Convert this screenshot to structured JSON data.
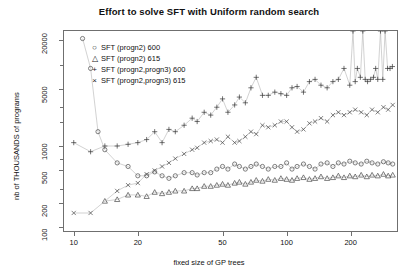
{
  "chart_data": {
    "type": "scatter",
    "title": "Effort to solve SFT with Uniform random search",
    "xlabel": "fixed size of GP trees",
    "ylabel": "nb of THOUSANDS of programs",
    "xscale": "log",
    "yscale": "log",
    "xlim": [
      9,
      330
    ],
    "ylim": [
      90,
      26000
    ],
    "xticks": [
      10,
      20,
      50,
      100,
      200
    ],
    "xticklabels": [
      "10",
      "20",
      "50",
      "100",
      "200"
    ],
    "yticks": [
      100,
      200,
      500,
      1000,
      5000,
      20000
    ],
    "yticklabels": [
      "100",
      "200",
      "500",
      "1000",
      "5000",
      "20000"
    ],
    "grid": false,
    "legend_position": "top-left",
    "lines": true,
    "series": [
      {
        "name": "SFT (progn2) 600",
        "symbol": "circle",
        "color": "#4a4a4a",
        "points": [
          [
            11,
            21000
          ],
          [
            12,
            9000
          ],
          [
            13,
            1500
          ],
          [
            14,
            900
          ],
          [
            16,
            620
          ],
          [
            18,
            560
          ],
          [
            20,
            430
          ],
          [
            22,
            430
          ],
          [
            24,
            480
          ],
          [
            26,
            430
          ],
          [
            28,
            400
          ],
          [
            30,
            430
          ],
          [
            33,
            470
          ],
          [
            36,
            470
          ],
          [
            38,
            440
          ],
          [
            41,
            470
          ],
          [
            44,
            470
          ],
          [
            47,
            520
          ],
          [
            50,
            560
          ],
          [
            53,
            520
          ],
          [
            57,
            600
          ],
          [
            60,
            560
          ],
          [
            64,
            520
          ],
          [
            68,
            560
          ],
          [
            72,
            600
          ],
          [
            77,
            560
          ],
          [
            82,
            520
          ],
          [
            88,
            560
          ],
          [
            94,
            560
          ],
          [
            100,
            620
          ],
          [
            106,
            520
          ],
          [
            112,
            560
          ],
          [
            120,
            600
          ],
          [
            128,
            560
          ],
          [
            136,
            520
          ],
          [
            145,
            600
          ],
          [
            155,
            620
          ],
          [
            165,
            560
          ],
          [
            175,
            620
          ],
          [
            186,
            600
          ],
          [
            198,
            650
          ],
          [
            210,
            620
          ],
          [
            224,
            600
          ],
          [
            238,
            650
          ],
          [
            252,
            620
          ],
          [
            268,
            600
          ],
          [
            285,
            640
          ],
          [
            300,
            620
          ],
          [
            315,
            600
          ]
        ]
      },
      {
        "name": "SFT (progn2) 615",
        "symbol": "triangle",
        "color": "#4a4a4a",
        "points": [
          [
            14,
            210
          ],
          [
            16,
            220
          ],
          [
            18,
            250
          ],
          [
            20,
            250
          ],
          [
            22,
            240
          ],
          [
            24,
            270
          ],
          [
            26,
            260
          ],
          [
            28,
            270
          ],
          [
            30,
            280
          ],
          [
            33,
            280
          ],
          [
            36,
            300
          ],
          [
            38,
            300
          ],
          [
            41,
            320
          ],
          [
            44,
            320
          ],
          [
            47,
            330
          ],
          [
            50,
            340
          ],
          [
            53,
            330
          ],
          [
            57,
            350
          ],
          [
            60,
            360
          ],
          [
            64,
            340
          ],
          [
            68,
            360
          ],
          [
            72,
            380
          ],
          [
            77,
            370
          ],
          [
            82,
            390
          ],
          [
            88,
            380
          ],
          [
            94,
            400
          ],
          [
            100,
            390
          ],
          [
            106,
            380
          ],
          [
            112,
            400
          ],
          [
            120,
            410
          ],
          [
            128,
            390
          ],
          [
            136,
            400
          ],
          [
            145,
            420
          ],
          [
            155,
            400
          ],
          [
            165,
            410
          ],
          [
            175,
            430
          ],
          [
            186,
            410
          ],
          [
            198,
            430
          ],
          [
            210,
            420
          ],
          [
            224,
            440
          ],
          [
            238,
            420
          ],
          [
            252,
            440
          ],
          [
            268,
            430
          ],
          [
            285,
            450
          ],
          [
            300,
            430
          ],
          [
            315,
            440
          ]
        ]
      },
      {
        "name": "SFT (progn2,progn3) 600",
        "symbol": "plus",
        "color": "#3a3a3a",
        "points": [
          [
            10,
            1100
          ],
          [
            12,
            850
          ],
          [
            14,
            1000
          ],
          [
            16,
            1000
          ],
          [
            18,
            1050
          ],
          [
            20,
            1100
          ],
          [
            22,
            1200
          ],
          [
            24,
            1500
          ],
          [
            26,
            1100
          ],
          [
            28,
            1600
          ],
          [
            30,
            1500
          ],
          [
            33,
            1800
          ],
          [
            36,
            2200
          ],
          [
            38,
            2000
          ],
          [
            41,
            2600
          ],
          [
            44,
            2400
          ],
          [
            47,
            3000
          ],
          [
            50,
            3800
          ],
          [
            53,
            2600
          ],
          [
            57,
            3200
          ],
          [
            60,
            4000
          ],
          [
            64,
            3400
          ],
          [
            68,
            5200
          ],
          [
            72,
            7000
          ],
          [
            77,
            4200
          ],
          [
            82,
            4200
          ],
          [
            88,
            4600
          ],
          [
            94,
            4400
          ],
          [
            100,
            4200
          ],
          [
            106,
            5200
          ],
          [
            112,
            5400
          ],
          [
            120,
            4600
          ],
          [
            128,
            6200
          ],
          [
            136,
            6600
          ],
          [
            145,
            5600
          ],
          [
            155,
            5200
          ],
          [
            165,
            6200
          ],
          [
            175,
            6600
          ],
          [
            186,
            9000
          ],
          [
            198,
            5600
          ],
          [
            205,
            26000
          ],
          [
            210,
            6200
          ],
          [
            215,
            9000
          ],
          [
            222,
            7000
          ],
          [
            228,
            26000
          ],
          [
            234,
            6600
          ],
          [
            240,
            6200
          ],
          [
            248,
            6600
          ],
          [
            256,
            7000
          ],
          [
            262,
            9000
          ],
          [
            268,
            6600
          ],
          [
            276,
            26000
          ],
          [
            283,
            6600
          ],
          [
            290,
            26000
          ],
          [
            298,
            9000
          ],
          [
            306,
            9000
          ],
          [
            314,
            9500
          ]
        ]
      },
      {
        "name": "SFT (progn2,progn3) 615",
        "symbol": "cross",
        "color": "#4a4a4a",
        "points": [
          [
            10,
            150
          ],
          [
            12,
            150
          ],
          [
            16,
            280
          ],
          [
            18,
            330
          ],
          [
            20,
            350
          ],
          [
            22,
            450
          ],
          [
            24,
            500
          ],
          [
            26,
            560
          ],
          [
            28,
            620
          ],
          [
            30,
            700
          ],
          [
            33,
            800
          ],
          [
            36,
            900
          ],
          [
            38,
            950
          ],
          [
            41,
            1100
          ],
          [
            44,
            1150
          ],
          [
            47,
            1200
          ],
          [
            50,
            1100
          ],
          [
            53,
            1300
          ],
          [
            57,
            1100
          ],
          [
            60,
            1150
          ],
          [
            64,
            1300
          ],
          [
            68,
            1500
          ],
          [
            72,
            1400
          ],
          [
            77,
            1800
          ],
          [
            82,
            1700
          ],
          [
            88,
            1800
          ],
          [
            94,
            2000
          ],
          [
            100,
            2000
          ],
          [
            106,
            1700
          ],
          [
            112,
            1500
          ],
          [
            120,
            1600
          ],
          [
            128,
            1900
          ],
          [
            136,
            2000
          ],
          [
            145,
            2200
          ],
          [
            155,
            2000
          ],
          [
            165,
            2400
          ],
          [
            175,
            2600
          ],
          [
            186,
            2400
          ],
          [
            198,
            2600
          ],
          [
            210,
            2800
          ],
          [
            224,
            2600
          ],
          [
            238,
            2400
          ],
          [
            252,
            2800
          ],
          [
            268,
            2600
          ],
          [
            285,
            3000
          ],
          [
            300,
            2800
          ],
          [
            315,
            3200
          ]
        ]
      }
    ]
  },
  "legend": {
    "items": [
      {
        "symbol": "○",
        "label": "SFT (progn2) 600"
      },
      {
        "symbol": "△",
        "label": "SFT (progn2) 615"
      },
      {
        "symbol": "+",
        "label": "SFT (progn2,progn3) 600"
      },
      {
        "symbol": "×",
        "label": "SFT (progn2,progn3) 615"
      }
    ]
  }
}
